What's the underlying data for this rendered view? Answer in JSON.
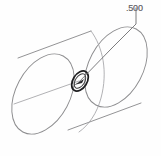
{
  "figure": {
    "kind": "engineering-drawing",
    "view": "isometric",
    "background_color": "#fefefe",
    "outline_color": "#8d8d8f",
    "hole_color": "#1d1d1f",
    "leader_color": "#6e6e71",
    "text_color": "#6a6a6d"
  },
  "annotations": {
    "dimension_label": ".500",
    "leader_note": "leader-line-from-hole-to-dimension"
  },
  "geometry": {
    "near_end_ellipse": {
      "center_x": 43,
      "center_y": 94,
      "radius_x": 27,
      "radius_y": 43,
      "rotation_deg": 28
    },
    "far_end_ellipse": {
      "center_x": 116,
      "center_y": 67,
      "radius_x": 27,
      "radius_y": 43,
      "rotation_deg": 28
    },
    "hole_ellipse": {
      "center_x": 80,
      "center_y": 81,
      "radius_x": 7,
      "radius_y": 11,
      "rotation_deg": 32
    },
    "leader_elbow_x": 112,
    "leader_elbow_y": 48,
    "leader_vertical_top_y": 14,
    "leader_vertical_x": 136
  }
}
